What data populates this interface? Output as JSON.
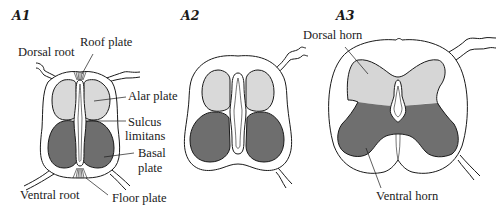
{
  "figure": {
    "panels": [
      {
        "id": "A1",
        "label": "A1",
        "annotations": {
          "dorsal_root": "Dorsal root",
          "roof_plate": "Roof plate",
          "alar_plate": "Alar plate",
          "sulcus_limitans_line1": "Sulcus",
          "sulcus_limitans_line2": "limitans",
          "basal_plate_line1": "Basal",
          "basal_plate_line2": "plate",
          "ventral_root": "Ventral root",
          "floor_plate": "Floor plate"
        }
      },
      {
        "id": "A2",
        "label": "A2",
        "annotations": {}
      },
      {
        "id": "A3",
        "label": "A3",
        "annotations": {
          "dorsal_horn": "Dorsal horn",
          "ventral_horn": "Ventral horn"
        }
      }
    ],
    "colors": {
      "alar_plate_fill": "#d9d9d9",
      "basal_plate_fill": "#6e6e6e",
      "dorsal_horn_fill": "#d6d6d6",
      "ventral_horn_fill": "#6f6f6f",
      "outline": "#1a1a1a",
      "background": "#ffffff"
    }
  }
}
